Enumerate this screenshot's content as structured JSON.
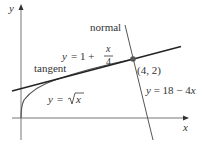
{
  "diagram": {
    "axes": {
      "x_label": "x",
      "y_label": "y"
    },
    "curve": {
      "label_y": "y",
      "label_eq": "=",
      "label_fn": "x",
      "expression": "y = sqrt(x)"
    },
    "tangent": {
      "name": "tangent",
      "label_y": "y",
      "label_rhs": "= 1 +",
      "frac_num": "x",
      "frac_den": "4",
      "expression": "y = 1 + x/4"
    },
    "normal": {
      "name": "normal",
      "label": "y = 18 − 4",
      "label_x": "x",
      "expression": "y = 18 - 4x"
    },
    "point": {
      "label": "(4, 2)",
      "x": 4,
      "y": 2
    },
    "colors": {
      "line": "#222222",
      "curve": "#555555",
      "axis": "#777777",
      "point": "#555555"
    }
  }
}
